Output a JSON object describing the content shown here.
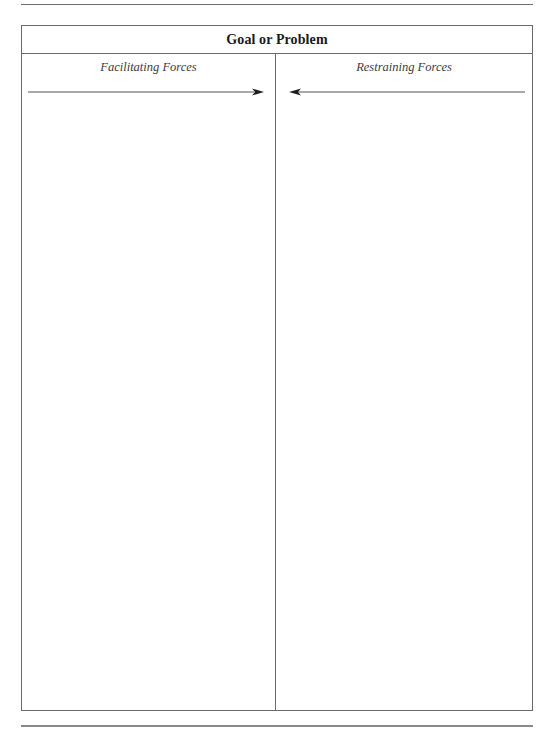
{
  "document": {
    "title": "Goal or Problem",
    "columns": [
      {
        "label": "Facilitating Forces",
        "arrow_direction": "right",
        "entries": []
      },
      {
        "label": "Restraining Forces",
        "arrow_direction": "left",
        "entries": []
      }
    ]
  },
  "colors": {
    "line": "#6a6a6a",
    "title_text": "#1a1a1a",
    "label_text": "#3c3c3c",
    "arrow": "#2a2a2a"
  }
}
